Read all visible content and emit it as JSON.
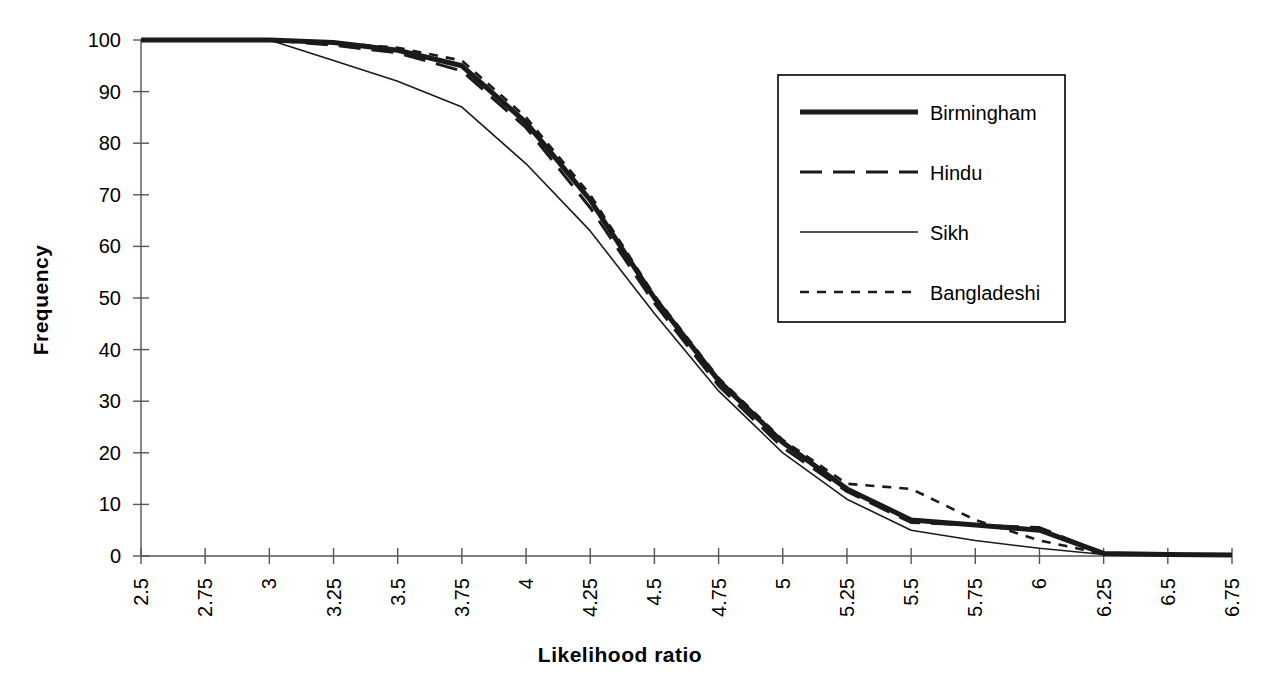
{
  "chart_data": {
    "type": "line",
    "title": "",
    "xlabel": "Likelihood ratio",
    "ylabel": "Frequency",
    "xlim": [
      2.5,
      6.75
    ],
    "ylim": [
      0,
      100
    ],
    "grid": false,
    "legend_position": "upper-right",
    "xticks": [
      "2.5",
      "2.75",
      "3",
      "3.25",
      "3.5",
      "3.75",
      "4",
      "4.25",
      "4.5",
      "4.75",
      "5",
      "5.25",
      "5.5",
      "5.75",
      "6",
      "6.25",
      "6.5",
      "6.75"
    ],
    "yticks": [
      "0",
      "10",
      "20",
      "30",
      "40",
      "50",
      "60",
      "70",
      "80",
      "90",
      "100"
    ],
    "x": [
      2.5,
      2.75,
      3,
      3.25,
      3.5,
      3.75,
      4,
      4.25,
      4.5,
      4.75,
      5,
      5.25,
      5.5,
      5.75,
      6,
      6.25,
      6.5,
      6.75
    ],
    "series": [
      {
        "name": "Birmingham",
        "style": "thick-solid",
        "color": "#1a1a1a",
        "values": [
          100,
          100,
          100,
          99.5,
          98,
          95,
          84,
          69,
          50,
          34,
          22,
          13,
          7,
          6,
          5,
          0.5,
          0.3,
          0.2
        ]
      },
      {
        "name": "Hindu",
        "style": "long-dash",
        "color": "#1a1a1a",
        "values": [
          100,
          100,
          100,
          99,
          97.5,
          94,
          83,
          67.5,
          49,
          33,
          21,
          12.5,
          6.5,
          6,
          5.5,
          0.5,
          0.3,
          0.2
        ]
      },
      {
        "name": "Sikh",
        "style": "thin-solid",
        "color": "#1a1a1a",
        "values": [
          100,
          100,
          100,
          96,
          92,
          87,
          76,
          63,
          47,
          32,
          20,
          11,
          5,
          3,
          1.5,
          0.3,
          0.2,
          0.2
        ]
      },
      {
        "name": "Bangladeshi",
        "style": "short-dash",
        "color": "#1a1a1a",
        "values": [
          100,
          100,
          100,
          99.5,
          98.5,
          96,
          85,
          70,
          50.5,
          34.5,
          22.5,
          14,
          13,
          7,
          3,
          0.4,
          0.3,
          0.2
        ]
      }
    ]
  },
  "axis": {
    "x_title": "Likelihood ratio",
    "y_title": "Frequency"
  },
  "legend": {
    "entries": [
      {
        "label": "Birmingham",
        "style": "thick-solid"
      },
      {
        "label": "Hindu",
        "style": "long-dash"
      },
      {
        "label": "Sikh",
        "style": "thin-solid"
      },
      {
        "label": "Bangladeshi",
        "style": "short-dash"
      }
    ]
  }
}
